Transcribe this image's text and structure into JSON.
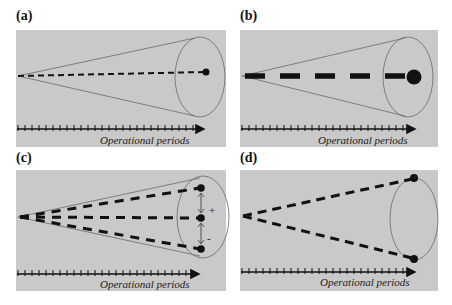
{
  "figure": {
    "background_color": "#c9c9c9",
    "line_color": "#111111",
    "cone_color": "#6a6a6a",
    "panels": [
      {
        "id": "a",
        "label": "(a)",
        "axis_label": "Operational periods",
        "description": "Single thin dashed line from cone apex to small dot at cone base center",
        "paths": 1,
        "dot_size": "small",
        "line_weight": "thin"
      },
      {
        "id": "b",
        "label": "(b)",
        "axis_label": "Operational periods",
        "description": "Single thick dashed line from cone apex to large dot at cone base center",
        "paths": 1,
        "dot_size": "large",
        "line_weight": "thick"
      },
      {
        "id": "c",
        "label": "(c)",
        "axis_label": "Operational periods",
        "description": "Three dashed lines fanning from apex to three dots inside cone base, with double arrows between dots",
        "paths": 3,
        "dot_size": "small",
        "line_weight": "medium",
        "annotations": [
          "+",
          "-"
        ]
      },
      {
        "id": "d",
        "label": "(d)",
        "axis_label": "Operational periods",
        "description": "Two dashed lines from apex to dots at top and bottom of cone base ellipse",
        "paths": 2,
        "dot_size": "small",
        "line_weight": "medium"
      }
    ]
  }
}
